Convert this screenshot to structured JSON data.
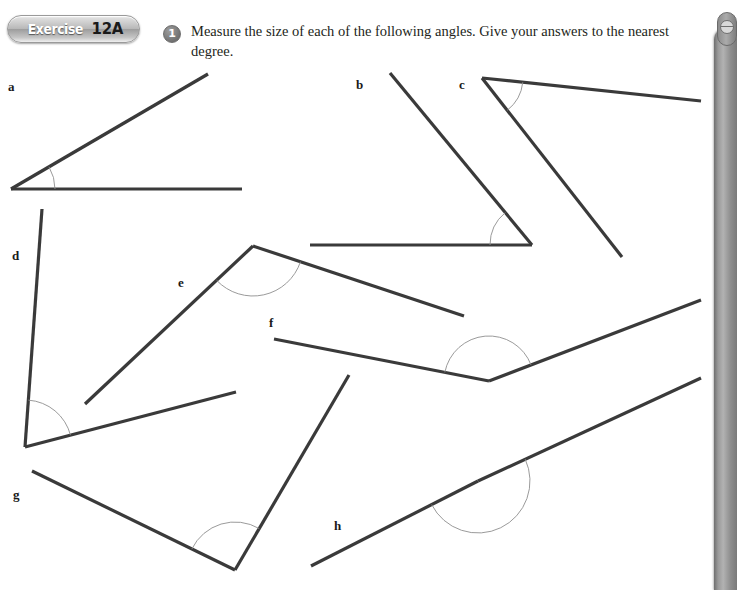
{
  "header": {
    "badge_word": "Exercise",
    "badge_number": "12A",
    "question_number": "1",
    "question_text": "Measure the size of each of the following angles. Give your answers to the nearest degree."
  },
  "colors": {
    "line": "#3a3a3a",
    "arc": "#8f8f8f",
    "page_background": "#ffffff",
    "badge_text": "#ffffff",
    "badge_number_text": "#1a1a1a",
    "sidebar": "#9a9a9a",
    "text": "#231f20"
  },
  "figures": [
    {
      "label": "a",
      "label_pos": {
        "x": 8,
        "y": 79
      },
      "vertex": {
        "x": 11,
        "y": 189
      },
      "ray1": {
        "x": 242,
        "y": 189
      },
      "ray2": {
        "x": 208,
        "y": 74
      },
      "arc_radius": 44
    },
    {
      "label": "b",
      "label_pos": {
        "x": 356,
        "y": 77
      },
      "vertex": {
        "x": 532,
        "y": 245
      },
      "ray1": {
        "x": 310,
        "y": 245
      },
      "ray2": {
        "x": 390,
        "y": 73
      },
      "arc_radius": 42
    },
    {
      "label": "c",
      "label_pos": {
        "x": 459,
        "y": 77
      },
      "vertex": {
        "x": 482,
        "y": 78
      },
      "ray1": {
        "x": 701,
        "y": 101
      },
      "ray2": {
        "x": 622,
        "y": 257
      },
      "arc_radius": 41
    },
    {
      "label": "d",
      "label_pos": {
        "x": 12,
        "y": 248
      },
      "vertex": {
        "x": 25,
        "y": 447
      },
      "ray1": {
        "x": 42,
        "y": 209
      },
      "ray2": {
        "x": 236,
        "y": 392
      },
      "arc_radius": 47
    },
    {
      "label": "e",
      "label_pos": {
        "x": 178,
        "y": 275
      },
      "vertex": {
        "x": 253,
        "y": 246
      },
      "ray1": {
        "x": 85,
        "y": 404
      },
      "ray2": {
        "x": 464,
        "y": 316
      },
      "arc_radius": 50
    },
    {
      "label": "f",
      "label_pos": {
        "x": 269,
        "y": 315
      },
      "vertex": {
        "x": 489,
        "y": 381
      },
      "ray1": {
        "x": 274,
        "y": 339
      },
      "ray2": {
        "x": 701,
        "y": 300
      },
      "arc_radius": 45
    },
    {
      "label": "g",
      "label_pos": {
        "x": 13,
        "y": 487
      },
      "vertex": {
        "x": 235,
        "y": 570
      },
      "ray1": {
        "x": 32,
        "y": 471
      },
      "ray2": {
        "x": 349,
        "y": 375
      },
      "arc_radius": 48
    },
    {
      "label": "h",
      "label_pos": {
        "x": 334,
        "y": 518
      },
      "vertex": {
        "x": 478,
        "y": 481
      },
      "ray1": {
        "x": 311,
        "y": 566
      },
      "ray2": {
        "x": 701,
        "y": 378
      },
      "arc_radius": 52
    }
  ]
}
